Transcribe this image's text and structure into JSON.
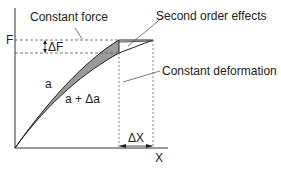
{
  "diagram": {
    "labels": {
      "constant_force": "Constant force",
      "second_order": "Second order effects",
      "constant_deformation": "Constant deformation",
      "y_axis": "F",
      "x_axis": "X",
      "delta_f": "ΔF",
      "delta_x": "ΔX",
      "curve_a": "a",
      "curve_a_plus": "a + Δa"
    },
    "colors": {
      "line": "#222222",
      "fill": "#9a9a9a",
      "dash": "#666666"
    }
  }
}
